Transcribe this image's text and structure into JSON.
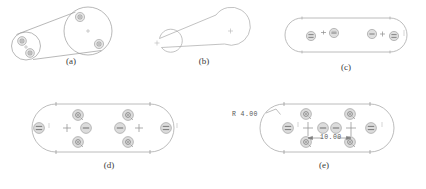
{
  "figure": {
    "type": "engineering-drawing",
    "background_color": "#ffffff",
    "line_color": "#8a8a8a",
    "dark_line_color": "#6b6b6b",
    "symbol_fill": "#d9d9d9",
    "symbol_stroke": "#8f8f8f",
    "text_color": "#3a3a3a"
  },
  "panels": [
    {
      "id": "a",
      "caption": "(a)",
      "kind": "isometric-solid",
      "shapes": "two tangent circles joined by straight tangent lines, pictorial 3D view",
      "symbols": [
        "concentric-constraint",
        "concentric-constraint",
        "concentric-constraint",
        "concentric-constraint"
      ],
      "center_marks": 1
    },
    {
      "id": "b",
      "caption": "(b)",
      "kind": "outline-profile",
      "shapes": "large circle right, small circle left, tangent connecting lines",
      "center_marks": 2
    },
    {
      "id": "c",
      "caption": "(c)",
      "kind": "obround-profile",
      "symbols": [
        "equal-constraint",
        "tangent-constraint",
        "horizontal-constraint",
        "horizontal-constraint",
        "tangent-constraint",
        "equal-constraint"
      ],
      "center_marks": 0
    },
    {
      "id": "d",
      "caption": "(d)",
      "kind": "obround-constrained",
      "symbols": [
        "equal-constraint",
        "coincident-point",
        "horizontal-constraint",
        "concentric-constraint",
        "concentric-constraint",
        "horizontal-constraint",
        "coincident-point",
        "equal-constraint"
      ],
      "center_marks": 2
    },
    {
      "id": "e",
      "caption": "(e)",
      "kind": "obround-dimensioned",
      "symbols": [
        "equal-constraint",
        "horizontal-constraint",
        "horizontal-constraint",
        "equal-constraint",
        "concentric-constraint",
        "concentric-constraint",
        "concentric-constraint",
        "concentric-constraint"
      ],
      "dimensions": [
        {
          "name": "radius-dimension",
          "label": "R 4.00",
          "kind": "radius"
        },
        {
          "name": "length-dimension",
          "label": "10.00",
          "kind": "linear"
        }
      ],
      "center_marks": 2
    }
  ],
  "captions": {
    "a": "(a)",
    "b": "(b)",
    "c": "(c)",
    "d": "(d)",
    "e": "(e)"
  },
  "dimensions": {
    "radius": "R 4.00",
    "length": "10.00"
  }
}
